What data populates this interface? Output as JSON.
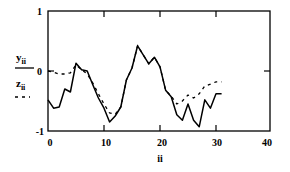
{
  "chart_data": {
    "type": "line",
    "title": "",
    "xlabel": "ii",
    "ylabel": "",
    "xlim": [
      0,
      40
    ],
    "ylim": [
      -1,
      1
    ],
    "x_ticks": [
      "0",
      "10",
      "20",
      "30",
      "40"
    ],
    "y_ticks": [
      "1",
      "0",
      "-1"
    ],
    "grid": false,
    "legend_position": "left",
    "x": [
      0,
      1,
      2,
      3,
      4,
      5,
      6,
      7,
      8,
      9,
      10,
      11,
      12,
      13,
      14,
      15,
      16,
      17,
      18,
      19,
      20,
      21,
      22,
      23,
      24,
      25,
      26,
      27,
      28,
      29,
      30,
      31
    ],
    "series": [
      {
        "name": "y_ii",
        "style": "solid",
        "color": "#000000",
        "values": [
          -0.48,
          -0.62,
          -0.6,
          -0.3,
          -0.35,
          0.13,
          0.02,
          0.0,
          -0.23,
          -0.45,
          -0.62,
          -0.85,
          -0.75,
          -0.6,
          -0.15,
          0.05,
          0.42,
          0.27,
          0.12,
          0.23,
          0.07,
          -0.32,
          -0.43,
          -0.73,
          -0.82,
          -0.55,
          -0.82,
          -0.93,
          -0.48,
          -0.62,
          -0.38,
          -0.38
        ]
      },
      {
        "name": "z_ii",
        "style": "dashed",
        "color": "#000000",
        "values": [
          0.0,
          -0.02,
          -0.05,
          -0.05,
          -0.03,
          0.1,
          0.02,
          -0.05,
          -0.2,
          -0.38,
          -0.55,
          -0.7,
          -0.72,
          -0.6,
          -0.15,
          0.05,
          0.42,
          0.27,
          0.12,
          0.23,
          0.07,
          -0.32,
          -0.42,
          -0.55,
          -0.5,
          -0.4,
          -0.45,
          -0.38,
          -0.25,
          -0.22,
          -0.18,
          -0.18
        ]
      }
    ]
  },
  "legend": {
    "y_main": "y",
    "y_sub": "ii",
    "z_main": "z",
    "z_sub": "ii"
  },
  "axes": {
    "x_label": "ii",
    "x_tick_0": "0",
    "x_tick_10": "10",
    "x_tick_20": "20",
    "x_tick_30": "30",
    "x_tick_40": "40",
    "y_tick_top": "1",
    "y_tick_mid": "0",
    "y_tick_bottom": "-1"
  }
}
